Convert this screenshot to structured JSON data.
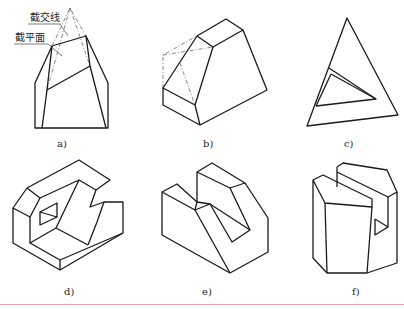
{
  "figure": {
    "annotations": {
      "intersection_line": "截交线",
      "cutting_plane": "截平面"
    },
    "panels": [
      {
        "id": "a",
        "label": "a)"
      },
      {
        "id": "b",
        "label": "b)"
      },
      {
        "id": "c",
        "label": "c)"
      },
      {
        "id": "d",
        "label": "d)"
      },
      {
        "id": "e",
        "label": "e)"
      },
      {
        "id": "f",
        "label": "f)"
      }
    ]
  }
}
